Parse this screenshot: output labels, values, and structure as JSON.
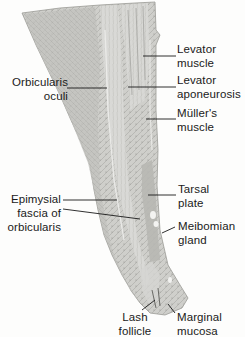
{
  "figure": {
    "labels": {
      "levator_muscle": [
        "Levator",
        "muscle"
      ],
      "orbicularis_oculi": [
        "Orbicularis",
        "oculi"
      ],
      "levator_aponeurosis": [
        "Levator",
        "aponeurosis"
      ],
      "mullers_muscle": [
        "Müller's",
        "muscle"
      ],
      "epimysial_fascia": [
        "Epimysial",
        "fascia of",
        "orbicularis"
      ],
      "tarsal_plate": [
        "Tarsal",
        "plate"
      ],
      "meibomian_gland": [
        "Meibomian",
        "gland"
      ],
      "lash_follicle": [
        "Lash",
        "follicle"
      ],
      "marginal_mucosa": [
        "Marginal",
        "mucosa"
      ]
    },
    "colors": {
      "background": "#fdfdfc",
      "tissue_light": "#d9d9d6",
      "tissue_mid": "#bdbdb9",
      "tissue_dark": "#9a9a96",
      "leader_line": "#1a1a1a",
      "text": "#1a1a1a"
    }
  }
}
